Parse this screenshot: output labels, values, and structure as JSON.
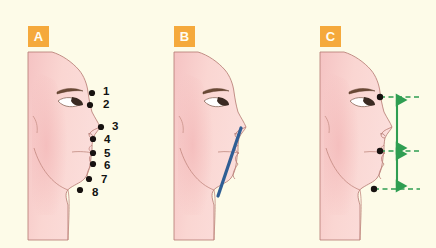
{
  "figure": {
    "background_color": "#fdfbe8",
    "badge_color": "#f5a93c",
    "badge_text_color": "#fffdf2",
    "skin_light": "#fbdcd6",
    "skin_mid": "#f6c6c3",
    "skin_deep": "#eeb0b2",
    "outline_color": "#b07a72",
    "landmark_color": "#171210",
    "blue_line_color": "#2f5e94",
    "green_line_color": "#2f9e52"
  },
  "panels": [
    {
      "id": "A",
      "badge": "A",
      "caption_points": [
        {
          "num": "1",
          "label_x": 103,
          "label_y": 88,
          "dot_x": 92,
          "dot_y": 93
        },
        {
          "num": "2",
          "label_x": 103,
          "label_y": 101,
          "dot_x": 90,
          "dot_y": 105
        },
        {
          "num": "3",
          "label_x": 112,
          "label_y": 122,
          "dot_x": 101,
          "dot_y": 127
        },
        {
          "num": "4",
          "label_x": 104,
          "label_y": 136,
          "dot_x": 93,
          "dot_y": 139
        },
        {
          "num": "5",
          "label_x": 104,
          "label_y": 150,
          "dot_x": 93,
          "dot_y": 153
        },
        {
          "num": "6",
          "label_x": 104,
          "label_y": 163,
          "dot_x": 93,
          "dot_y": 164
        },
        {
          "num": "7",
          "label_x": 101,
          "label_y": 177,
          "dot_x": 89,
          "dot_y": 179
        },
        {
          "num": "8",
          "label_x": 92,
          "label_y": 190,
          "dot_x": 80,
          "dot_y": 190
        }
      ]
    },
    {
      "id": "B",
      "badge": "B",
      "aesthetic_line": {
        "name": "profile-aesthetic-line",
        "x1": 95,
        "y1": 128,
        "x2": 72,
        "y2": 196,
        "color": "#2f5e94",
        "width": 3.2
      }
    },
    {
      "id": "C",
      "badge": "C",
      "measure_points": [
        {
          "name": "upper-landmark",
          "x": 68,
          "y": 97
        },
        {
          "name": "middle-landmark",
          "x": 63,
          "y": 151
        },
        {
          "name": "lower-landmark",
          "x": 56,
          "y": 189
        }
      ],
      "dashed_guides": [
        {
          "name": "upper-guide",
          "y": 97,
          "x1": 68,
          "x2": 128
        },
        {
          "name": "middle-guide",
          "y": 151,
          "x1": 63,
          "x2": 128
        },
        {
          "name": "lower-guide",
          "y": 189,
          "x1": 56,
          "x2": 128
        }
      ],
      "measure_arrows": [
        {
          "name": "upper-third-arrow",
          "x": 105,
          "y1": 97,
          "y2": 151
        },
        {
          "name": "lower-third-arrow",
          "x": 105,
          "y1": 151,
          "y2": 189
        }
      ]
    }
  ]
}
